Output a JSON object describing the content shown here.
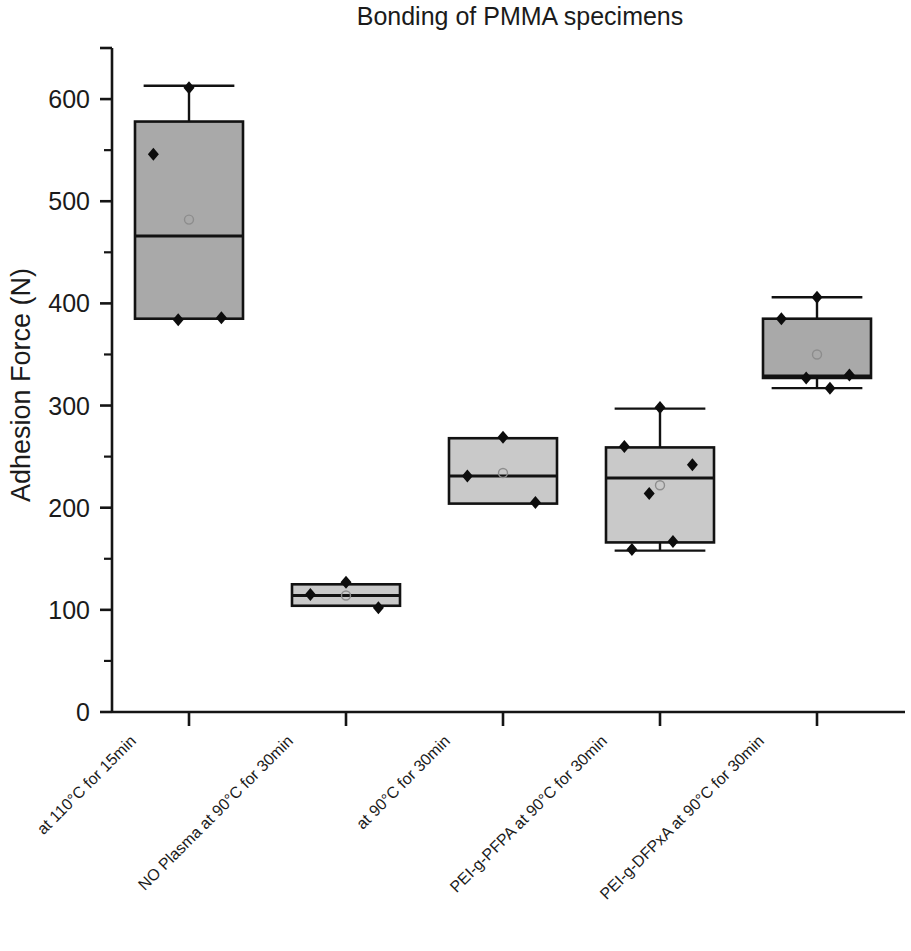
{
  "chart_data": {
    "type": "box",
    "title": "Bonding of PMMA specimens",
    "xlabel": "",
    "ylabel": "Adhesion Force (N)",
    "ylim": [
      0,
      650
    ],
    "yticks": [
      0,
      100,
      200,
      300,
      400,
      500,
      600
    ],
    "ytick_labels": [
      "0",
      "100",
      "200",
      "300",
      "400",
      "500",
      "600"
    ],
    "yminor_step": 50,
    "grid": false,
    "legend": null,
    "categories": [
      "at 110°C for 15min",
      "NO Plasma at 90°C for 30min",
      "at 90°C for 30min",
      "PEI-g-PFPA at 90°C for 30min",
      "PEI-g-DFPxA at 90°C for 30min"
    ],
    "boxes": [
      {
        "category": "at 110°C for 15min",
        "whisker_low": 385,
        "q1": 385,
        "median": 466,
        "q3": 578,
        "whisker_high": 613,
        "mean": 482,
        "points": [
          611,
          546,
          386,
          384
        ]
      },
      {
        "category": "NO Plasma at 90°C for 30min",
        "whisker_low": 104,
        "q1": 104,
        "median": 114,
        "q3": 125,
        "whisker_high": 125,
        "mean": 114,
        "points": [
          127,
          115,
          102
        ]
      },
      {
        "category": "at 90°C for 30min",
        "whisker_low": 204,
        "q1": 204,
        "median": 231,
        "q3": 268,
        "whisker_high": 268,
        "mean": 234,
        "points": [
          269,
          231,
          205
        ]
      },
      {
        "category": "PEI-g-PFPA at 90°C for 30min",
        "whisker_low": 158,
        "q1": 166,
        "median": 229,
        "q3": 259,
        "whisker_high": 297,
        "mean": 222,
        "points": [
          298,
          260,
          242,
          214,
          167,
          159
        ]
      },
      {
        "category": "PEI-g-DFPxA at 90°C for 30min",
        "whisker_low": 317,
        "q1": 327,
        "median": 329,
        "q3": 385,
        "whisker_high": 406,
        "mean": 350,
        "points": [
          406,
          385,
          330,
          327,
          317
        ]
      }
    ]
  },
  "colors": {
    "box_fill_light": "#c9c9c9",
    "box_fill_dark": "#a9a9a9",
    "outline": "#121212",
    "point": "#0d0d0d",
    "background": "#ffffff"
  }
}
